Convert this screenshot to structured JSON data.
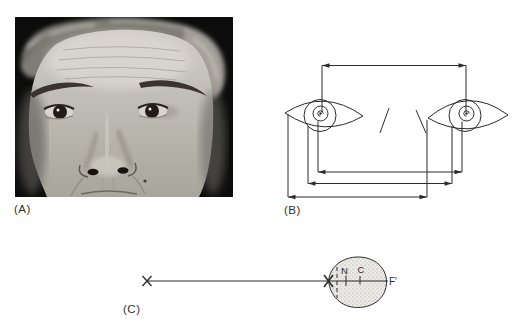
{
  "page": {
    "background": "#ffffff"
  },
  "figure": {
    "ink_color": "#2b2b2b",
    "panel_a": {
      "label": "(A)",
      "type": "photograph",
      "alt": "Black-and-white close-up photograph of a man's face from forehead to upper lip, both eyes looking forward, on a black background"
    },
    "panel_b": {
      "label": "(B)",
      "type": "line-diagram",
      "alt": "Schematic of two eyes with nose marks and four horizontal dimension lines with outward arrowheads indicating pupillary and canthal distance measurements"
    },
    "panel_c": {
      "label": "(C)",
      "type": "line-diagram",
      "point_labels": {
        "n": "N",
        "c": "C",
        "f_prime": "F′"
      },
      "alt": "Horizontal visual-axis line from a fixation X to a stippled eye globe containing nodal point N, center of rotation C, and focal point F prime"
    }
  },
  "colors": {
    "photo_background": "#0c0c0c",
    "globe_fill": "#eceae6",
    "globe_stipple": "#c6c4bf"
  }
}
